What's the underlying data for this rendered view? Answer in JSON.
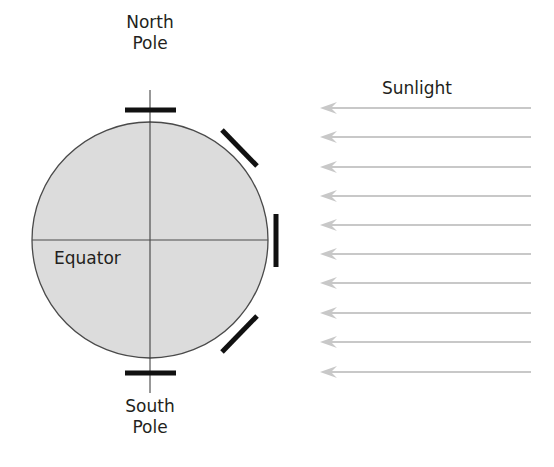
{
  "labels": {
    "north_pole": [
      "North",
      "Pole"
    ],
    "south_pole": [
      "South",
      "Pole"
    ],
    "equator": "Equator",
    "sunlight": "Sunlight"
  },
  "colors": {
    "earth_fill": "#dcdcdc",
    "earth_stroke": "#4a4a4a",
    "axis": "#333333",
    "plate": "#111111",
    "sun_ray": "#c8c8c8",
    "text": "#231f20"
  },
  "earth": {
    "cx": 150,
    "cy": 240,
    "r": 118
  },
  "plates": [
    {
      "name": "north-pole-plate",
      "x1": 125,
      "y1": 110,
      "x2": 176,
      "y2": 110
    },
    {
      "name": "upper-diagonal-plate",
      "x1": 222,
      "y1": 130,
      "x2": 257,
      "y2": 166
    },
    {
      "name": "equator-plate",
      "x1": 276,
      "y1": 214,
      "x2": 276,
      "y2": 267
    },
    {
      "name": "lower-diagonal-plate",
      "x1": 222,
      "y1": 352,
      "x2": 257,
      "y2": 316
    },
    {
      "name": "south-pole-plate",
      "x1": 125,
      "y1": 373,
      "x2": 176,
      "y2": 373
    }
  ],
  "sun_rays": {
    "x_start": 531,
    "x_end": 320,
    "y_positions": [
      108,
      137,
      167,
      196,
      225,
      254,
      283,
      313,
      342,
      372
    ]
  }
}
